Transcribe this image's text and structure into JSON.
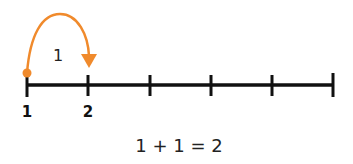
{
  "number_line": {
    "ticks": [
      {
        "x": 27,
        "label": "1"
      },
      {
        "x": 88,
        "label": "2"
      },
      {
        "x": 150,
        "label": ""
      },
      {
        "x": 211,
        "label": ""
      },
      {
        "x": 272,
        "label": ""
      },
      {
        "x": 333,
        "label": ""
      }
    ],
    "line_color": "#111111"
  },
  "jump": {
    "from": "1",
    "to": "2",
    "label": "1",
    "color": "#F08A2C"
  },
  "labels": {
    "tick_1": "1",
    "tick_2": "2"
  },
  "equation": "1 + 1 = 2"
}
